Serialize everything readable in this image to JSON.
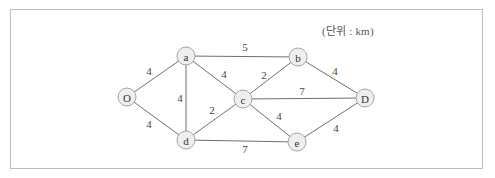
{
  "diagram": {
    "unit_label": "(단위 : km)",
    "colors": {
      "border": "#bdbdbd",
      "edge": "#6f6f6f",
      "node_fill": "#efefef",
      "node_stroke": "#a5a5a5",
      "text": "#333333"
    },
    "nodes": [
      {
        "id": "O",
        "label": "O",
        "x": 127,
        "y": 97
      },
      {
        "id": "a",
        "label": "a",
        "x": 186,
        "y": 56
      },
      {
        "id": "b",
        "label": "b",
        "x": 298,
        "y": 57
      },
      {
        "id": "c",
        "label": "c",
        "x": 243,
        "y": 99
      },
      {
        "id": "D",
        "label": "D",
        "x": 365,
        "y": 98
      },
      {
        "id": "d",
        "label": "d",
        "x": 186,
        "y": 140
      },
      {
        "id": "e",
        "label": "e",
        "x": 297,
        "y": 142
      }
    ],
    "edges": [
      {
        "from": "O",
        "to": "a",
        "weight": "4",
        "lx": 149,
        "ly": 71
      },
      {
        "from": "O",
        "to": "d",
        "weight": "4",
        "lx": 149,
        "ly": 124
      },
      {
        "from": "a",
        "to": "b",
        "weight": "5",
        "lx": 245,
        "ly": 47
      },
      {
        "from": "a",
        "to": "c",
        "weight": "4",
        "lx": 224,
        "ly": 74
      },
      {
        "from": "a",
        "to": "d",
        "weight": "4",
        "lx": 180,
        "ly": 98
      },
      {
        "from": "b",
        "to": "c",
        "weight": "2",
        "lx": 264,
        "ly": 75
      },
      {
        "from": "b",
        "to": "D",
        "weight": "4",
        "lx": 335,
        "ly": 71
      },
      {
        "from": "c",
        "to": "D",
        "weight": "7",
        "lx": 302,
        "ly": 91
      },
      {
        "from": "c",
        "to": "d",
        "weight": "2",
        "lx": 212,
        "ly": 110
      },
      {
        "from": "c",
        "to": "e",
        "weight": "4",
        "lx": 279,
        "ly": 116
      },
      {
        "from": "d",
        "to": "e",
        "weight": "7",
        "lx": 245,
        "ly": 149
      },
      {
        "from": "e",
        "to": "D",
        "weight": "4",
        "lx": 336,
        "ly": 128
      }
    ]
  }
}
